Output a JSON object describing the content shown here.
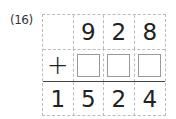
{
  "problem": {
    "number_label": "(16)",
    "operator": "+",
    "top_row": [
      "",
      "9",
      "2",
      "8"
    ],
    "answer_boxes": [
      "",
      "",
      ""
    ],
    "result_row": [
      "1",
      "5",
      "2",
      "4"
    ]
  }
}
